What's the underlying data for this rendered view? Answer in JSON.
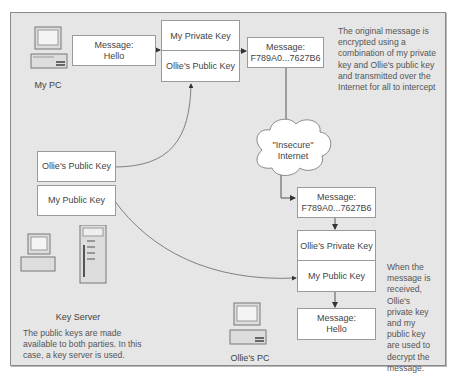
{
  "sender": {
    "pc_label": "My PC",
    "message_box": {
      "title": "Message:",
      "body": "Hello"
    },
    "key_box": {
      "top": "My Private Key",
      "bottom": "Ollie's Public Key"
    },
    "encrypted_box": {
      "title": "Message:",
      "body": "F789A0...7627B6"
    },
    "note": [
      "The original message is",
      "encrypted using a",
      "combination of my private",
      "key and Ollie's public key",
      "and transmitted over the",
      "Internet for all to intercept"
    ]
  },
  "network": {
    "cloud_line1": "\"Insecure\"",
    "cloud_line2": "Internet"
  },
  "key_server": {
    "public_key_ollie": "Ollie's Public Key",
    "public_key_mine": "My Public Key",
    "label": "Key Server",
    "note": [
      "The public keys are made",
      "available to both parties. In this",
      "case, a key server is used."
    ]
  },
  "receiver": {
    "pc_label": "Ollie's PC",
    "encrypted_box": {
      "title": "Message:",
      "body": "F789A0...7627B6"
    },
    "key_box": {
      "top": "Ollie's Private Key",
      "bottom": "My Public Key"
    },
    "message_box": {
      "title": "Message:",
      "body": "Hello"
    },
    "note": [
      "When the",
      "message is",
      "received,",
      "Ollie's",
      "private key",
      "and my",
      "public key",
      "are used to",
      "decrypt the",
      "message."
    ]
  },
  "colors": {
    "panel": "#e6e6e6",
    "box": "#ffffff",
    "line": "#555555"
  }
}
